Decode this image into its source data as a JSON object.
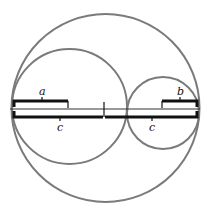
{
  "diagram": {
    "circles": [
      {
        "name": "outer-circle",
        "cx": 105.5,
        "cy": 108,
        "r": 94
      },
      {
        "name": "left-circle",
        "cx": 69.5,
        "cy": 106.5,
        "r": 57.5
      },
      {
        "name": "right-circle",
        "cx": 163,
        "cy": 113,
        "r": 36
      }
    ],
    "diameter_line": {
      "x1": 10,
      "x2": 200,
      "y": 109
    },
    "labels": {
      "a": "a",
      "b": "b",
      "c_left": "c",
      "c_right": "c"
    },
    "braces": [
      {
        "name": "brace-a",
        "label": "a",
        "x1": 13,
        "x2": 68,
        "y": 101,
        "tip_x": 42,
        "direction": "up"
      },
      {
        "name": "brace-b",
        "label": "b",
        "x1": 162,
        "x2": 198,
        "y": 101,
        "tip_x": 180,
        "direction": "up"
      },
      {
        "name": "brace-c-left",
        "label": "c",
        "x1": 13,
        "x2": 104,
        "y": 117,
        "tip_x": 60,
        "direction": "down"
      },
      {
        "name": "brace-c-right",
        "label": "c",
        "x1": 104,
        "x2": 198,
        "y": 117,
        "tip_x": 152,
        "direction": "down"
      }
    ]
  }
}
